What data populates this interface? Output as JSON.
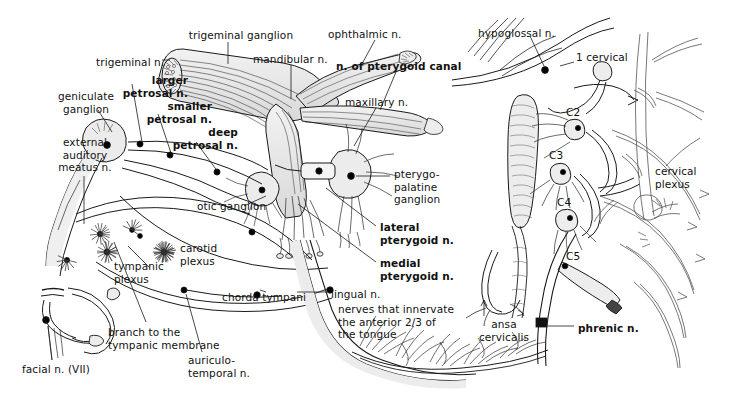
{
  "figure": {
    "style": "pen-and-ink anatomical line drawing, grayscale on white",
    "background_color": "#ffffff",
    "ink_color": "#111111",
    "fill_gray": "#e8e8e8",
    "width": 739,
    "height": 405
  },
  "panels": [
    {
      "name": "left-panel",
      "content": "trigeminal / facial nerve branches and tongue"
    },
    {
      "name": "right-panel",
      "content": "cervical plexus and phrenic nerve"
    }
  ],
  "labels": [
    {
      "id": "trigeminal-ganglion",
      "text": "trigeminal ganglion",
      "bold": false,
      "x": 186,
      "y": 29,
      "align": "center",
      "width": 110
    },
    {
      "id": "trigeminal-n",
      "text": "trigeminal n.",
      "bold": false,
      "x": 96,
      "y": 56,
      "align": "left",
      "width": 74
    },
    {
      "id": "mandibular-n",
      "text": "mandibular n.",
      "bold": false,
      "x": 253,
      "y": 53,
      "align": "left",
      "width": 82
    },
    {
      "id": "ophthalmic-n",
      "text": "ophthalmic n.",
      "bold": false,
      "x": 328,
      "y": 28,
      "align": "left",
      "width": 80
    },
    {
      "id": "n-of-pterygoid-canal",
      "text": "n. of pterygoid canal",
      "bold": true,
      "x": 336,
      "y": 60,
      "align": "left",
      "width": 128
    },
    {
      "id": "maxillary-n",
      "text": "maxillary n.",
      "bold": false,
      "x": 345,
      "y": 96,
      "align": "left",
      "width": 74
    },
    {
      "id": "larger-petrosal-n",
      "text": "larger\npetrosal n.",
      "bold": true,
      "x": 110,
      "y": 74,
      "align": "right",
      "width": 78
    },
    {
      "id": "smaller-petrosal-n",
      "text": "smaller\npetrosal n.",
      "bold": true,
      "x": 134,
      "y": 100,
      "align": "right",
      "width": 78
    },
    {
      "id": "deep-petrosal-n",
      "text": "deep\npetrosal n.",
      "bold": true,
      "x": 160,
      "y": 126,
      "align": "right",
      "width": 78
    },
    {
      "id": "geniculate-ganglion",
      "text": "geniculate\nganglion",
      "bold": false,
      "x": 50,
      "y": 90,
      "align": "center",
      "width": 72
    },
    {
      "id": "external-auditory-meatus-n",
      "text": "external\nauditory\nmeatus n.",
      "bold": false,
      "x": 52,
      "y": 136,
      "align": "center",
      "width": 66
    },
    {
      "id": "otic-ganglion",
      "text": "otic ganglion",
      "bold": false,
      "x": 197,
      "y": 200,
      "align": "left",
      "width": 80
    },
    {
      "id": "carotid-plexus",
      "text": "carotid\nplexus",
      "bold": false,
      "x": 180,
      "y": 242,
      "align": "left",
      "width": 50
    },
    {
      "id": "tympanic-plexus",
      "text": "tympanic\nplexus",
      "bold": false,
      "x": 114,
      "y": 260,
      "align": "left",
      "width": 56
    },
    {
      "id": "pterygopalatine-ganglion",
      "text": "pterygo-\npalatine\nganglion",
      "bold": false,
      "x": 394,
      "y": 168,
      "align": "left",
      "width": 62
    },
    {
      "id": "lateral-pterygoid-n",
      "text": "lateral\npterygoid n.",
      "bold": true,
      "x": 380,
      "y": 221,
      "align": "left",
      "width": 80
    },
    {
      "id": "medial-pterygoid-n",
      "text": "medial\npterygoid n.",
      "bold": true,
      "x": 380,
      "y": 257,
      "align": "left",
      "width": 80
    },
    {
      "id": "lingual-n",
      "text": "lingual n.",
      "bold": false,
      "x": 331,
      "y": 288,
      "align": "left",
      "width": 60
    },
    {
      "id": "tongue-innervation",
      "text": "nerves that innervate\nthe anterior 2/3 of\nthe tongue",
      "bold": false,
      "x": 338,
      "y": 303,
      "align": "left",
      "width": 130
    },
    {
      "id": "chorda-tympani",
      "text": "chorda tympani",
      "bold": false,
      "x": 222,
      "y": 291,
      "align": "left",
      "width": 92
    },
    {
      "id": "auriculotemporal-n",
      "text": "auriculo-\ntemporal n.",
      "bold": false,
      "x": 188,
      "y": 354,
      "align": "left",
      "width": 68
    },
    {
      "id": "branch-to-tympanic-membrane",
      "text": "branch to the\ntympanic membrane",
      "bold": false,
      "x": 108,
      "y": 326,
      "align": "left",
      "width": 110
    },
    {
      "id": "facial-n-vii",
      "text": "facial n. (VII)",
      "bold": false,
      "x": 22,
      "y": 363,
      "align": "left",
      "width": 78
    },
    {
      "id": "hypoglossal-n",
      "text": "hypoglossal n.",
      "bold": false,
      "x": 478,
      "y": 27,
      "align": "left",
      "width": 88
    },
    {
      "id": "first-cervical",
      "text": "1 cervical",
      "bold": false,
      "x": 576,
      "y": 51,
      "align": "left",
      "width": 60
    },
    {
      "id": "c2",
      "text": "C2",
      "bold": false,
      "x": 566,
      "y": 106,
      "align": "left",
      "width": 20
    },
    {
      "id": "c3",
      "text": "C3",
      "bold": false,
      "x": 549,
      "y": 149,
      "align": "left",
      "width": 20
    },
    {
      "id": "c4",
      "text": "C4",
      "bold": false,
      "x": 557,
      "y": 196,
      "align": "left",
      "width": 20
    },
    {
      "id": "c5",
      "text": "C5",
      "bold": false,
      "x": 566,
      "y": 250,
      "align": "left",
      "width": 20
    },
    {
      "id": "cervical-plexus",
      "text": "cervical\nplexus",
      "bold": false,
      "x": 655,
      "y": 165,
      "align": "left",
      "width": 56
    },
    {
      "id": "ansa-cervicalis",
      "text": "ansa\ncervicalis",
      "bold": false,
      "x": 473,
      "y": 318,
      "align": "center",
      "width": 62
    },
    {
      "id": "phrenic-n",
      "text": "phrenic n.",
      "bold": true,
      "x": 578,
      "y": 322,
      "align": "left",
      "width": 64
    }
  ]
}
